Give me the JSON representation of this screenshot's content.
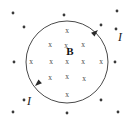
{
  "figure": {
    "background_color": "#ffffff",
    "loop": {
      "center_x": 67,
      "center_y": 62,
      "radius": 41,
      "stroke_color": "#4a4a4a",
      "stroke_width": 1
    },
    "field_label": {
      "text": "B",
      "x": 70,
      "y": 52,
      "color": "#111111",
      "meaning": "magnetic-field-vector-into-page"
    },
    "current_labels": [
      {
        "text": "I",
        "x": 120,
        "y": 38,
        "color": "#1a1a1a"
      },
      {
        "text": "I",
        "x": 29,
        "y": 102,
        "color": "#1a1a1a"
      }
    ],
    "arrowheads": [
      {
        "x": 98,
        "y": 30,
        "angle_deg": -42,
        "direction": "up-right"
      },
      {
        "x": 35,
        "y": 86,
        "angle_deg": 138,
        "direction": "down-left"
      }
    ],
    "inside_marks": {
      "symbol": "x",
      "meaning": "field-into-page",
      "color": "#4a4a4a",
      "points": [
        {
          "x": 67,
          "y": 31
        },
        {
          "x": 50,
          "y": 45
        },
        {
          "x": 66,
          "y": 46
        },
        {
          "x": 83,
          "y": 45
        },
        {
          "x": 31,
          "y": 62
        },
        {
          "x": 51,
          "y": 62
        },
        {
          "x": 67,
          "y": 62
        },
        {
          "x": 83,
          "y": 62
        },
        {
          "x": 101,
          "y": 62
        },
        {
          "x": 50,
          "y": 78
        },
        {
          "x": 67,
          "y": 77
        },
        {
          "x": 84,
          "y": 79
        },
        {
          "x": 67,
          "y": 95
        }
      ]
    },
    "outside_marks": {
      "symbol": "dot",
      "meaning": "field-out-of-page",
      "color": "#3a3a3a",
      "radius": 1.4,
      "points": [
        {
          "x": 13,
          "y": 13
        },
        {
          "x": 64,
          "y": 15
        },
        {
          "x": 117,
          "y": 11
        },
        {
          "x": 24,
          "y": 27
        },
        {
          "x": 101,
          "y": 25
        },
        {
          "x": 116,
          "y": 29
        },
        {
          "x": 14,
          "y": 62
        },
        {
          "x": 115,
          "y": 62
        },
        {
          "x": 24,
          "y": 100
        },
        {
          "x": 101,
          "y": 100
        },
        {
          "x": 13,
          "y": 112
        },
        {
          "x": 67,
          "y": 113
        },
        {
          "x": 118,
          "y": 112
        }
      ]
    }
  }
}
